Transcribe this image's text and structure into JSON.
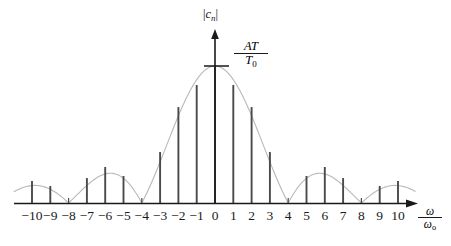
{
  "figure": {
    "kind": "line-spectrum-stem-plot",
    "y_axis_label": "|c_n|",
    "y_axis_label_parts": {
      "bar_left": "|",
      "symbol": "c",
      "subscript": "n",
      "bar_right": "|"
    },
    "amplitude_label": {
      "numerator": "AT",
      "denominator": "T",
      "denominator_sub": "0",
      "text": "AT/T0"
    },
    "x_axis_label": {
      "numerator": "ω",
      "denominator": "ω",
      "denominator_sub": "o",
      "text": "ω/ωo"
    },
    "ink_color": "#1a1a1a",
    "stem_color": "#4a4a4a",
    "envelope_color": "#b8b8b8",
    "axis_color": "#1a1a1a"
  },
  "axis": {
    "tick_labels": [
      "-10",
      "-9",
      "-8",
      "-7",
      "-6",
      "-5",
      "-4",
      "-3",
      "-2",
      "-1",
      "0",
      "1",
      "2",
      "3",
      "4",
      "5",
      "6",
      "7",
      "8",
      "9",
      "10"
    ],
    "tick_values": [
      -10,
      -9,
      -8,
      -7,
      -6,
      -5,
      -4,
      -3,
      -2,
      -1,
      0,
      1,
      2,
      3,
      4,
      5,
      6,
      7,
      8,
      9,
      10
    ],
    "baseline_y_px": 203,
    "origin_x_px": 215,
    "tick_spacing_px": 18.3,
    "peak_y_px": 66,
    "y_arrow_tip_px": 33
  },
  "chart_data": {
    "type": "bar",
    "title": "",
    "subtitle": "",
    "xlabel": "ω/ωo",
    "ylabel": "|c_n|",
    "grid": false,
    "legend": "none",
    "annotations": [
      "AT/T0 marks the peak amplitude at n = 0"
    ],
    "x": [
      -10,
      -9,
      -8,
      -7,
      -6,
      -5,
      -4,
      -3,
      -2,
      -1,
      0,
      1,
      2,
      3,
      4,
      5,
      6,
      7,
      8,
      9,
      10
    ],
    "categories": [
      "-10",
      "-9",
      "-8",
      "-7",
      "-6",
      "-5",
      "-4",
      "-3",
      "-2",
      "-1",
      "0",
      "1",
      "2",
      "3",
      "4",
      "5",
      "6",
      "7",
      "8",
      "9",
      "10"
    ],
    "values": [
      0.16,
      0.124,
      0.0,
      0.182,
      0.263,
      0.197,
      0.0,
      0.372,
      0.7,
      0.861,
      1.0,
      0.861,
      0.7,
      0.372,
      0.0,
      0.197,
      0.263,
      0.182,
      0.0,
      0.124,
      0.16
    ],
    "values_px_height": [
      22,
      17,
      0,
      25,
      36,
      27,
      0,
      51,
      96,
      118,
      137,
      118,
      96,
      51,
      0,
      27,
      36,
      25,
      0,
      17,
      22
    ],
    "ylim": [
      0,
      1.0
    ],
    "xlim": [
      -11,
      11
    ],
    "envelope": {
      "description": "|sinc| envelope with zero crossings at n = ±4 and n = ±8",
      "zero_crossings": [
        -8,
        -4,
        4,
        8
      ],
      "peak_value": 1.0,
      "peak_label": "AT/T0",
      "sidelobe_peaks": [
        {
          "x": -6,
          "y": 0.263
        },
        {
          "x": 6,
          "y": 0.263
        },
        {
          "x": -10,
          "y": 0.16
        },
        {
          "x": 10,
          "y": 0.16
        }
      ]
    }
  }
}
